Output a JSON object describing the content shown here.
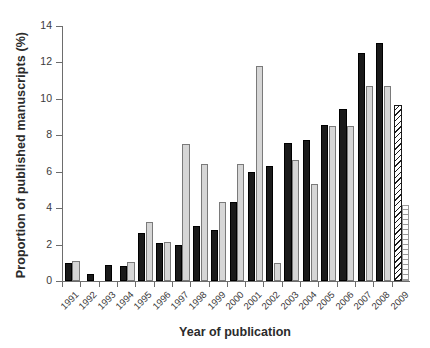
{
  "chart_data": {
    "type": "bar",
    "title": "",
    "xlabel": "Year of publication",
    "ylabel": "Proportion of published manuscripts (%)",
    "categories": [
      "1991",
      "1992",
      "1993",
      "1994",
      "1995",
      "1996",
      "1997",
      "1998",
      "1999",
      "2000",
      "2001",
      "2002",
      "2003",
      "2004",
      "2005",
      "2006",
      "2007",
      "2008",
      "2009"
    ],
    "ylim": [
      0,
      14
    ],
    "yticks": [
      0,
      2,
      4,
      6,
      8,
      10,
      12,
      14
    ],
    "ytick_labels": [
      "0",
      "2",
      "4",
      "6",
      "8",
      "10",
      "12",
      "14"
    ],
    "grid": false,
    "legend_position": "none",
    "series": [
      {
        "name": "series-1",
        "style": "black-filled",
        "color": "#1a1a1a",
        "values": [
          1.0,
          0.4,
          0.9,
          0.85,
          2.65,
          2.1,
          1.95,
          3.0,
          2.8,
          4.35,
          6.0,
          6.3,
          7.6,
          7.75,
          8.55,
          9.45,
          12.5,
          13.05,
          null
        ]
      },
      {
        "name": "series-2",
        "style": "grey-filled",
        "color": "#d6d6d6",
        "values": [
          1.1,
          null,
          null,
          1.05,
          3.25,
          2.15,
          7.5,
          6.45,
          4.35,
          6.45,
          11.8,
          1.0,
          6.65,
          5.35,
          8.5,
          8.5,
          10.7,
          10.7,
          null
        ]
      },
      {
        "name": "series-1-projected",
        "style": "diagonal-hatched",
        "color": "#ffffff",
        "values": [
          null,
          null,
          null,
          null,
          null,
          null,
          null,
          null,
          null,
          null,
          null,
          null,
          null,
          null,
          null,
          null,
          null,
          null,
          9.65
        ]
      },
      {
        "name": "series-2-projected",
        "style": "horizontal-hatched",
        "color": "#ffffff",
        "values": [
          null,
          null,
          null,
          null,
          null,
          null,
          null,
          null,
          null,
          null,
          null,
          null,
          null,
          null,
          null,
          null,
          null,
          null,
          4.2
        ]
      }
    ]
  }
}
